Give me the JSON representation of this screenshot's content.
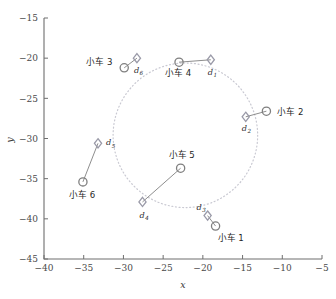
{
  "chart_data": {
    "type": "scatter",
    "title": "",
    "xlabel": "x",
    "ylabel": "y",
    "xlim": [
      -40,
      -5
    ],
    "ylim": [
      -45,
      -15
    ],
    "xticks": [
      -40,
      -35,
      -30,
      -25,
      -20,
      -15,
      -10,
      -5
    ],
    "yticks": [
      -45,
      -40,
      -35,
      -30,
      -25,
      -20,
      -15
    ],
    "grid": false,
    "legend": "none",
    "colors": {
      "vehicle_marker": "#7f7f7f",
      "target_marker": "#9a9aa8",
      "connector": "#8e8e8e",
      "formation_circle": "#c9c9d2",
      "axis": "#6e6e6e",
      "text": "#1f1f1f"
    },
    "annotations": {
      "formation_circle": {
        "center_x": -22.2,
        "center_y": -29.6,
        "radius": 9.1,
        "style": "dotted"
      }
    },
    "series": [
      {
        "name": "vehicles",
        "marker": "circle",
        "points": [
          {
            "id": "v1",
            "label": "小车 1",
            "x": -18.4,
            "y": -40.9,
            "label_dx": 2,
            "label_dy": 15
          },
          {
            "id": "v2",
            "label": "小车 2",
            "x": -12.0,
            "y": -26.6,
            "label_dx": 11,
            "label_dy": 4
          },
          {
            "id": "v3",
            "label": "小车 3",
            "x": -29.9,
            "y": -21.2,
            "label_dx": -38,
            "label_dy": -3
          },
          {
            "id": "v4",
            "label": "小车 4",
            "x": -23.0,
            "y": -20.5,
            "label_dx": -14,
            "label_dy": 14
          },
          {
            "id": "v5",
            "label": "小车 5",
            "x": -22.8,
            "y": -33.7,
            "label_dx": -12,
            "label_dy": -10
          },
          {
            "id": "v6",
            "label": "小车 6",
            "x": -35.1,
            "y": -35.4,
            "label_dx": -14,
            "label_dy": 16
          }
        ]
      },
      {
        "name": "targets",
        "marker": "diamond",
        "points": [
          {
            "id": "t1",
            "label": "d",
            "sub": "1",
            "x": -19.0,
            "y": -20.2,
            "label_dx": -3,
            "label_dy": 15
          },
          {
            "id": "t2",
            "label": "d",
            "sub": "2",
            "x": -14.6,
            "y": -27.3,
            "label_dx": -4,
            "label_dy": 14
          },
          {
            "id": "t3",
            "label": "d",
            "sub": "3",
            "x": -19.4,
            "y": -39.6,
            "label_dx": -11,
            "label_dy": -6
          },
          {
            "id": "t4",
            "label": "d",
            "sub": "4",
            "x": -27.6,
            "y": -37.9,
            "label_dx": -3,
            "label_dy": 16
          },
          {
            "id": "t5",
            "label": "d",
            "sub": "5",
            "x": -33.2,
            "y": -30.6,
            "label_dx": 8,
            "label_dy": 2
          },
          {
            "id": "t6",
            "label": "d",
            "sub": "6",
            "x": -28.3,
            "y": -20.0,
            "label_dx": -3,
            "label_dy": 15
          }
        ]
      }
    ],
    "connectors": [
      {
        "from": "v1",
        "to": "t3"
      },
      {
        "from": "v2",
        "to": "t2"
      },
      {
        "from": "v3",
        "to": "t6"
      },
      {
        "from": "v4",
        "to": "t1"
      },
      {
        "from": "v5",
        "to": "t4"
      },
      {
        "from": "v6",
        "to": "t5"
      }
    ]
  }
}
